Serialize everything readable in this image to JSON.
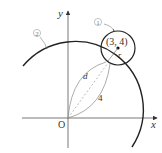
{
  "diagram": {
    "axes": {
      "x_label": "x",
      "y_label": "y",
      "origin_label": "O"
    },
    "circle_1": {
      "marker": "①",
      "center_label": "(3, 4)",
      "radius_label": "r"
    },
    "circle_2": {
      "marker": "②"
    },
    "segments": {
      "upper_curve_label": "d",
      "lower_curve_label": "4"
    },
    "colors": {
      "stroke": "#222222",
      "light_stroke": "#888888",
      "dashed": "#aaaaaa",
      "background": "#ffffff"
    }
  }
}
